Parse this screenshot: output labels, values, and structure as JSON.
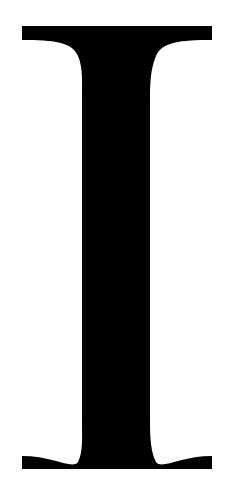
{
  "glyph": {
    "character": "I",
    "style": "serif capital letter",
    "fill_color": "#000000",
    "background_color": "#ffffff"
  }
}
